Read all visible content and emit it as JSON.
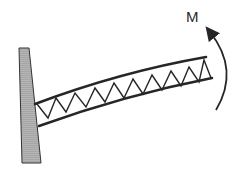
{
  "diagram": {
    "type": "cantilever-truss-with-moment",
    "labels": {
      "moment": "M"
    },
    "elements": {
      "support": "fixed-wall",
      "beam": "cantilever-truss",
      "load": "applied-moment-counterclockwise"
    },
    "colors": {
      "wall_fill": "#a8a8a8",
      "stroke": "#262626",
      "background": "#ffffff"
    }
  }
}
